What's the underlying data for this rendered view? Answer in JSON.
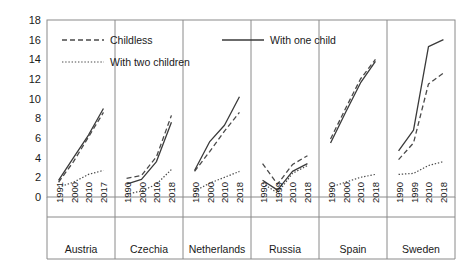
{
  "chart_data": {
    "type": "line",
    "title": "",
    "xlabel": "",
    "ylabel": "",
    "ylim": [
      0,
      18
    ],
    "ytick_step": 2,
    "yticks": [
      "0",
      "2",
      "4",
      "6",
      "8",
      "10",
      "12",
      "14",
      "16",
      "18"
    ],
    "grid": false,
    "legend_position": "top-left inside plot",
    "legend": [
      {
        "label": "Childless",
        "style": "dashed"
      },
      {
        "label": "With one child",
        "style": "solid"
      },
      {
        "label": "With two children",
        "style": "dotted"
      }
    ],
    "panels": [
      {
        "country": "Austria",
        "x": [
          "1991",
          "2000",
          "2010",
          "2017"
        ],
        "series": [
          {
            "name": "Childless",
            "style": "dashed",
            "values": [
              1.5,
              3.6,
              6.1,
              8.6
            ]
          },
          {
            "name": "With one child",
            "style": "solid",
            "values": [
              1.7,
              4.0,
              6.3,
              9.0
            ]
          },
          {
            "name": "With two children",
            "style": "dotted",
            "values": [
              1.0,
              1.5,
              2.3,
              2.7
            ]
          }
        ]
      },
      {
        "country": "Czechia",
        "x": [
          "1990",
          "2000",
          "2010",
          "2018"
        ],
        "series": [
          {
            "name": "Childless",
            "style": "dashed",
            "values": [
              1.9,
              2.2,
              4.1,
              8.3
            ]
          },
          {
            "name": "With one child",
            "style": "solid",
            "values": [
              1.3,
              1.8,
              3.6,
              7.6
            ]
          },
          {
            "name": "With two children",
            "style": "dotted",
            "values": [
              0.3,
              0.6,
              1.3,
              2.8
            ]
          }
        ]
      },
      {
        "country": "Netherlands",
        "x": [
          "1990",
          "2000",
          "2010",
          "2018"
        ],
        "series": [
          {
            "name": "Childless",
            "style": "dashed",
            "values": [
              2.6,
              4.6,
              6.7,
              8.6
            ]
          },
          {
            "name": "With one child",
            "style": "solid",
            "values": [
              2.7,
              5.6,
              7.3,
              10.2
            ]
          },
          {
            "name": "With two children",
            "style": "dotted",
            "values": [
              0.6,
              1.4,
              2.0,
              2.6
            ]
          }
        ]
      },
      {
        "country": "Russia",
        "x": [
          "1990",
          "1999",
          "2010",
          "2018"
        ],
        "series": [
          {
            "name": "Childless",
            "style": "dashed",
            "values": [
              3.4,
              1.3,
              3.3,
              4.2
            ]
          },
          {
            "name": "With one child",
            "style": "solid",
            "values": [
              1.7,
              0.7,
              2.6,
              3.4
            ]
          },
          {
            "name": "With two children",
            "style": "dotted",
            "values": [
              1.4,
              0.4,
              2.4,
              3.2
            ]
          }
        ]
      },
      {
        "country": "Spain",
        "x": [
          "1990",
          "2000",
          "2010",
          "2018"
        ],
        "series": [
          {
            "name": "Childless",
            "style": "dashed",
            "values": [
              5.9,
              9.0,
              12.0,
              14.0
            ]
          },
          {
            "name": "With one child",
            "style": "solid",
            "values": [
              5.5,
              8.6,
              11.6,
              13.8
            ]
          },
          {
            "name": "With two children",
            "style": "dotted",
            "values": [
              1.0,
              1.5,
              2.0,
              2.3
            ]
          }
        ]
      },
      {
        "country": "Sweden",
        "x": [
          "1990",
          "1999",
          "2010",
          "2018"
        ],
        "series": [
          {
            "name": "Childless",
            "style": "dashed",
            "values": [
              3.8,
              5.5,
              11.5,
              12.6
            ]
          },
          {
            "name": "With one child",
            "style": "solid",
            "values": [
              4.7,
              6.8,
              15.3,
              16.0
            ]
          },
          {
            "name": "With two children",
            "style": "dotted",
            "values": [
              2.3,
              2.4,
              3.2,
              3.6
            ]
          }
        ]
      }
    ]
  },
  "axis": {
    "plot_left": 47,
    "plot_right": 455,
    "plot_top": 20,
    "plot_bottom": 197
  }
}
